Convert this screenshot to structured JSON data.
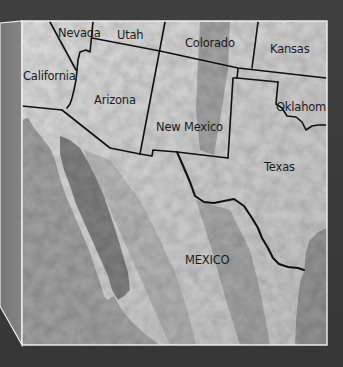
{
  "map": {
    "title": "Southwestern United States and Mexico relief map",
    "colors": {
      "background": "#3b3b3b",
      "side_panel": "#7e7e7e",
      "frame_line": "#f2f2f2",
      "land_light": "#d4d4d4",
      "land_mid": "#bdbdbd",
      "land_shadow": "#a6a6a6",
      "pacific": "#9c9c9c",
      "gulf_of_california": "#7a7a7a",
      "gulf_of_mexico": "#8e8e8e",
      "border_line": "#111111",
      "label_text": "#1b1b1b"
    },
    "frame": {
      "x": 22,
      "y": 21,
      "width": 305,
      "height": 324
    },
    "side_panel": {
      "points": "0,23 22,21 22,345 0,306"
    },
    "labels": [
      {
        "id": "nevada",
        "text": "Nevada",
        "x": 58,
        "y": 37
      },
      {
        "id": "utah",
        "text": "Utah",
        "x": 117,
        "y": 39
      },
      {
        "id": "colorado",
        "text": "Colorado",
        "x": 185,
        "y": 47
      },
      {
        "id": "kansas",
        "text": "Kansas",
        "x": 270,
        "y": 53
      },
      {
        "id": "california",
        "text": "California",
        "x": 23,
        "y": 80
      },
      {
        "id": "arizona",
        "text": "Arizona",
        "x": 94,
        "y": 104
      },
      {
        "id": "oklahoma",
        "text": "Oklahoma",
        "x": 276,
        "y": 111
      },
      {
        "id": "new-mexico",
        "text": "New Mexico",
        "x": 156,
        "y": 131
      },
      {
        "id": "texas",
        "text": "Texas",
        "x": 264,
        "y": 171
      },
      {
        "id": "mexico",
        "text": "MEXICO",
        "x": 185,
        "y": 264
      }
    ],
    "borders": [
      {
        "id": "ca-nv",
        "d": "M50,22 L76,70"
      },
      {
        "id": "nv-az-river",
        "d": "M93,22 L90,52 L86,50 L80,52 L78,60 L77,70"
      },
      {
        "id": "ca-az-river",
        "d": "M77,70 L76,80 L74,90 L72,98 L70,104 L67,108"
      },
      {
        "id": "parallel-37",
        "d": "M92,38 L160,51 L238,68 L326,78"
      },
      {
        "id": "ut-co-az-nm",
        "d": "M165,22 L140,154"
      },
      {
        "id": "co-ks",
        "d": "M258,22 L252,68"
      },
      {
        "id": "nm-tx",
        "d": "M238,69 L237,78 L233,78 L228,158"
      },
      {
        "id": "ok-panhandle",
        "d": "M237,78 L278,82"
      },
      {
        "id": "ok-tx-red-river",
        "d": "M278,82 L276,104 L282,108 L287,116 L296,117 L302,122 L306,130 L312,126 L318,125 L326,125"
      },
      {
        "id": "ca-mx",
        "d": "M22,106 L62,110"
      },
      {
        "id": "az-mx",
        "d": "M62,110 L110,148 L140,154"
      },
      {
        "id": "nm-mx-bootheel",
        "d": "M140,154 L152,156 L153,150 L177,152"
      },
      {
        "id": "nm-south",
        "d": "M177,152 L228,158"
      }
    ],
    "rio_grande": {
      "id": "tx-mx-rio-grande",
      "d": "M177,152 L184,168 L190,182 L195,196 L204,202 L214,203 L224,201 L234,199 L244,206 L252,218 L258,228 L262,238 L268,248 L273,258 L279,264 L288,267 L298,268 L304,270"
    },
    "water": {
      "pacific": "M22,345 L22,120 L28,118 L34,128 L42,138 L50,148 L55,160 L60,178 L66,196 L72,210 L78,224 L84,238 L90,252 L95,268 L100,282 L104,296 L108,300 L114,296 L122,310 L132,322 L145,334 L160,345 Z",
      "gulf_of_california": "M60,136 L70,140 L80,148 L88,162 L96,178 L104,196 L110,214 L116,232 L122,252 L128,272 L130,290 L124,296 L118,300 L112,290 L108,276 L100,258 L92,240 L84,222 L76,204 L70,186 L64,170 L60,154 Z",
      "gulf_of_mexico": "M327,228 L318,232 L310,240 L306,252 L305,262 L304,272 L300,282 L298,300 L296,320 L295,345 L327,345 Z"
    },
    "shading": [
      {
        "id": "rockies-shadow",
        "d": "M200,22 L230,22 L228,70 L220,120 L214,155 L200,150 L196,110 L198,60 Z",
        "opacity": 0.22
      },
      {
        "id": "sierra-madre-occ-ridge",
        "d": "M84,150 L110,160 L140,200 L160,240 L178,280 L190,320 L196,345 L170,345 L150,300 L128,250 L106,200 L90,170 Z",
        "opacity": 0.12
      },
      {
        "id": "sierra-madre-oriental",
        "d": "M196,200 L230,210 L250,250 L260,290 L270,345 L240,345 L226,300 L212,250 Z",
        "opacity": 0.18
      }
    ]
  }
}
